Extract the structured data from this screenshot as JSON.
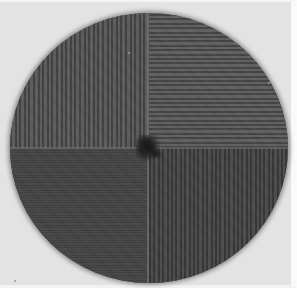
{
  "image": {
    "description": "Grayscale photograph of a circular specimen divided into four quadrants with differing line-grating orientations and a dark central spot",
    "background_color": "#e3e3e3",
    "disc": {
      "center_px": [
        148,
        146
      ],
      "radius_px": [
        139,
        135
      ],
      "quadrants": [
        {
          "position": "top-left",
          "pattern": "vertical stripes",
          "tone": "#4e4e4e"
        },
        {
          "position": "top-right",
          "pattern": "horizontal stripes",
          "tone": "#525252"
        },
        {
          "position": "bottom-left",
          "pattern": "fine horizontal texture",
          "tone": "#434343"
        },
        {
          "position": "bottom-right",
          "pattern": "vertical stripes",
          "tone": "#404040"
        }
      ],
      "center_feature": "dark irregular spot"
    }
  }
}
